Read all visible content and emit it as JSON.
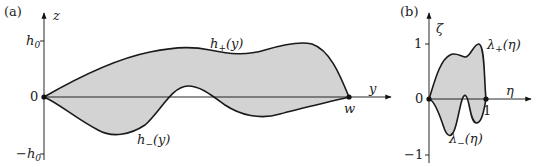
{
  "panel_a": {
    "label": "(a)",
    "vertical_axis": "z",
    "horizontal_axis": "y",
    "ticks": {
      "top": "h",
      "top_sub": "0",
      "zero": "0",
      "bottom_prefix": "−h",
      "bottom_sub": "0"
    },
    "endpoint_label": "w",
    "upper_curve": {
      "name": "h",
      "sub": "+",
      "arg": "(y)"
    },
    "lower_curve": {
      "name": "h",
      "sub": "−",
      "arg": "(y)"
    },
    "fill_color": "#d3d3d3",
    "stroke_color": "#1a1a1a"
  },
  "panel_b": {
    "label": "(b)",
    "vertical_axis": "ζ",
    "horizontal_axis": "η",
    "ticks": {
      "top": "1",
      "zero": "0",
      "bottom": "−1",
      "end": "1"
    },
    "upper_curve": {
      "name": "λ",
      "sub": "+",
      "arg": "(η)"
    },
    "lower_curve": {
      "name": "λ",
      "sub": "−",
      "arg": "(η)"
    },
    "fill_color": "#d3d3d3",
    "stroke_color": "#1a1a1a"
  }
}
